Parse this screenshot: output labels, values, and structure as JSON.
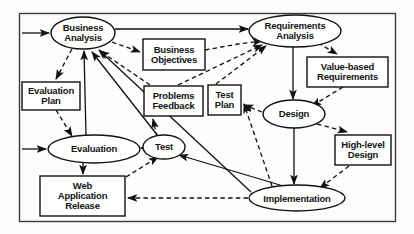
{
  "diagram": {
    "frame": {
      "name": "outer-frame",
      "stroke": "#3a3a3a"
    },
    "style": {
      "node_stroke": "#1a1a1a",
      "node_fill": "#ffffff",
      "solid_edge_color": "#111111",
      "dashed_edge_color": "#111111",
      "background": "#fdfdfd"
    },
    "nodes": [
      {
        "id": "business_analysis",
        "label": "Business\nAnalysis",
        "shape": "ellipse",
        "cx": 83,
        "cy": 33,
        "rx": 32,
        "ry": 16,
        "font": 9.5
      },
      {
        "id": "requirements_analysis",
        "label": "Requirements\nAnalysis",
        "shape": "ellipse",
        "cx": 295,
        "cy": 31,
        "rx": 46,
        "ry": 16,
        "font": 9.5
      },
      {
        "id": "business_objectives",
        "label": "Business\nObjectives",
        "shape": "rect",
        "x": 143,
        "y": 39,
        "w": 62,
        "h": 31,
        "font": 9.5
      },
      {
        "id": "value_based_req",
        "label": "Value-based\nRequirements",
        "shape": "rect",
        "x": 307,
        "y": 57,
        "w": 81,
        "h": 30,
        "font": 9.5
      },
      {
        "id": "evaluation_plan",
        "label": "Evaluation\nPlan",
        "shape": "rect",
        "x": 22,
        "y": 82,
        "w": 58,
        "h": 28,
        "font": 9.5
      },
      {
        "id": "problems_feedback",
        "label": "Problems\nFeedback",
        "shape": "rect",
        "x": 144,
        "y": 86,
        "w": 59,
        "h": 30,
        "font": 9.5
      },
      {
        "id": "test_plan",
        "label": "Test\nPlan",
        "shape": "rect",
        "x": 208,
        "y": 85,
        "w": 33,
        "h": 30,
        "font": 9.5
      },
      {
        "id": "design",
        "label": "Design",
        "shape": "ellipse",
        "cx": 294,
        "cy": 114,
        "rx": 31,
        "ry": 14,
        "font": 9.5
      },
      {
        "id": "high_level_design",
        "label": "High-level\nDesign",
        "shape": "rect",
        "x": 335,
        "y": 135,
        "w": 56,
        "h": 30,
        "font": 9.5
      },
      {
        "id": "evaluation",
        "label": "Evaluation",
        "shape": "ellipse",
        "cx": 94,
        "cy": 149,
        "rx": 46,
        "ry": 14,
        "font": 9.5
      },
      {
        "id": "test",
        "label": "Test",
        "shape": "ellipse",
        "cx": 164,
        "cy": 147,
        "rx": 21,
        "ry": 12,
        "font": 9.5
      },
      {
        "id": "web_application_release",
        "label": "Web\nApplication\nRelease",
        "shape": "rect",
        "x": 40,
        "y": 176,
        "w": 85,
        "h": 40,
        "font": 9.5
      },
      {
        "id": "implementation",
        "label": "Implementation",
        "shape": "ellipse",
        "cx": 297,
        "cy": 198,
        "rx": 48,
        "ry": 13,
        "font": 9.5
      }
    ],
    "external_inputs": [
      {
        "id": "input-business-analysis",
        "from_x": 22,
        "to_x": 50,
        "y": 33
      },
      {
        "id": "input-evaluation",
        "from_x": 22,
        "to_x": 47,
        "y": 149
      }
    ],
    "edges": [
      {
        "id": "business-analysis-to-requirements-analysis",
        "style": "solid",
        "from": "business_analysis",
        "to": "requirements_analysis"
      },
      {
        "id": "business-analysis-to-business-objectives",
        "style": "dashed",
        "from": "business_analysis",
        "to": "business_objectives"
      },
      {
        "id": "business-analysis-to-evaluation-plan",
        "style": "dashed",
        "from": "business_analysis",
        "to": "evaluation_plan"
      },
      {
        "id": "business-objectives-to-requirements-analysis",
        "style": "dashed",
        "from": "business_objectives",
        "to": "requirements_analysis"
      },
      {
        "id": "problems-feedback-to-business-analysis",
        "style": "dashed",
        "from": "problems_feedback",
        "to": "business_analysis"
      },
      {
        "id": "test-to-business-analysis",
        "style": "solid",
        "from": "test",
        "to": "business_analysis"
      },
      {
        "id": "evaluation-to-business-analysis",
        "style": "solid",
        "from": "evaluation",
        "to": "business_analysis"
      },
      {
        "id": "implementation-to-business-analysis",
        "style": "solid",
        "from": "implementation",
        "to": "business_analysis"
      },
      {
        "id": "problems-feedback-to-requirements-analysis",
        "style": "dashed",
        "from": "problems_feedback",
        "to": "requirements_analysis"
      },
      {
        "id": "test-plan-to-requirements-analysis",
        "style": "dashed",
        "from": "test_plan",
        "to": "requirements_analysis"
      },
      {
        "id": "requirements-analysis-to-value-based",
        "style": "dashed",
        "from": "requirements_analysis",
        "to": "value_based_req"
      },
      {
        "id": "requirements-analysis-to-design",
        "style": "solid",
        "from": "requirements_analysis",
        "to": "design"
      },
      {
        "id": "value-based-to-design",
        "style": "dashed",
        "from": "value_based_req",
        "to": "design"
      },
      {
        "id": "design-to-test-plan",
        "style": "dashed",
        "from": "design",
        "to": "test_plan"
      },
      {
        "id": "design-to-high-level-design",
        "style": "dashed",
        "from": "design",
        "to": "high_level_design"
      },
      {
        "id": "design-to-implementation",
        "style": "solid",
        "from": "design",
        "to": "implementation"
      },
      {
        "id": "high-level-design-to-implementation",
        "style": "dashed",
        "from": "high_level_design",
        "to": "implementation"
      },
      {
        "id": "implementation-to-test",
        "style": "solid",
        "from": "implementation",
        "to": "test"
      },
      {
        "id": "implementation-to-web-application-release",
        "style": "dashed",
        "from": "implementation",
        "to": "web_application_release"
      },
      {
        "id": "implementation-to-test-plan",
        "style": "dashed",
        "from": "implementation",
        "to": "test_plan"
      },
      {
        "id": "test-to-evaluation",
        "style": "solid",
        "from": "test",
        "to": "evaluation"
      },
      {
        "id": "test-to-problems-feedback",
        "style": "dashed",
        "from": "test",
        "to": "problems_feedback"
      },
      {
        "id": "evaluation-plan-to-evaluation",
        "style": "dashed",
        "from": "evaluation_plan",
        "to": "evaluation"
      },
      {
        "id": "evaluation-to-web-application-release",
        "style": "solid",
        "from": "evaluation",
        "to": "web_application_release"
      },
      {
        "id": "web-application-release-to-test",
        "style": "dashed",
        "from": "web_application_release",
        "to": "test"
      }
    ]
  }
}
